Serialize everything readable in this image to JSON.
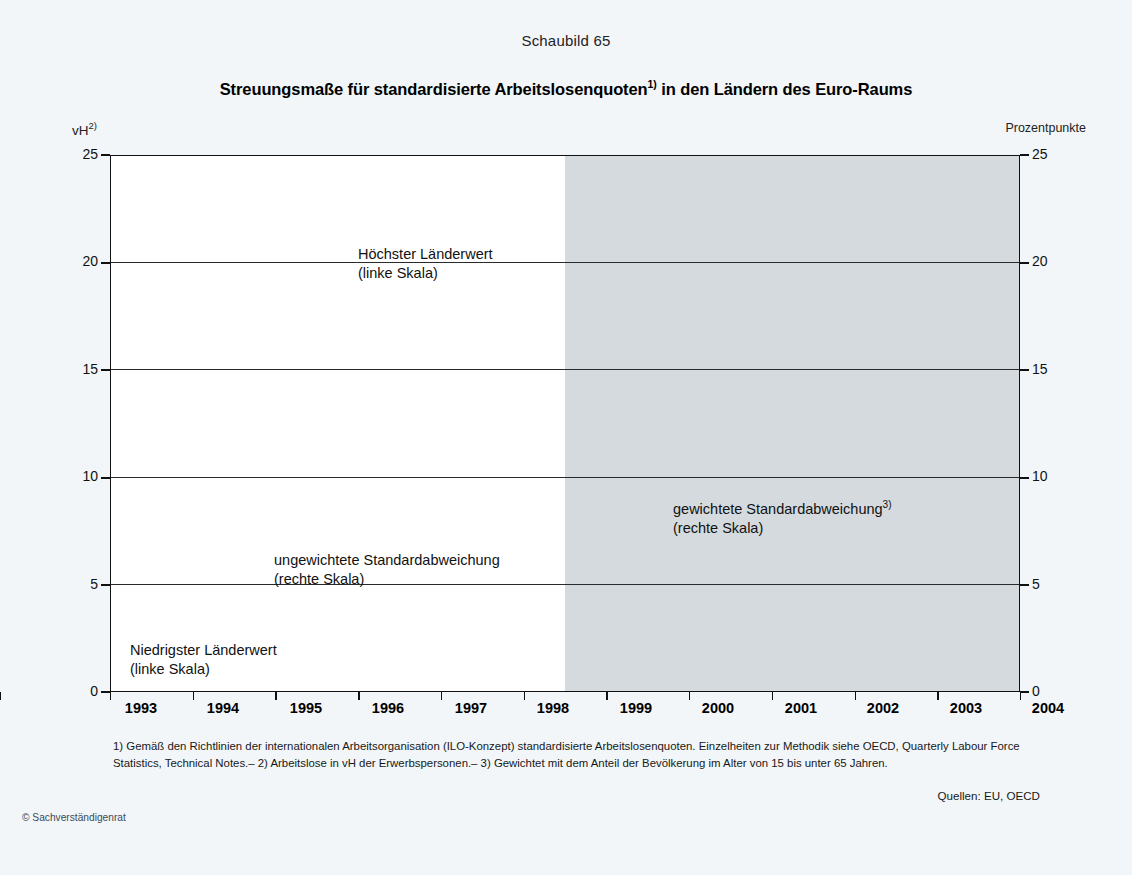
{
  "figure_number": "Schaubild 65",
  "title_main": "Streuungsmaße für standardisierte Arbeitslosenquoten",
  "title_sup": "1)",
  "title_tail": " in den Ländern des Euro-Raums",
  "axis": {
    "left_unit": "vH",
    "left_unit_sup": "2)",
    "right_unit": "Prozentpunkte"
  },
  "annotations": {
    "hoechster_l1": "Höchster Länderwert",
    "hoechster_l2": "(linke Skala)",
    "gewichtete_l1": "gewichtete Standardabweichung",
    "gewichtete_sup": "3)",
    "gewichtete_l2": "(rechte Skala)",
    "ungewichtete_l1": "ungewichtete Standardabweichung",
    "ungewichtete_l2": "(rechte Skala)",
    "niedrigster_l1": "Niedrigster Länderwert",
    "niedrigster_l2": "(linke Skala)"
  },
  "footnotes": "1) Gemäß den Richtlinien der internationalen Arbeitsorganisation (ILO-Konzept)  standardisierte Arbeitslosenquoten. Einzelheiten zur Methodik siehe OECD, Quarterly Labour Force Statistics, Technical Notes.– 2) Arbeitslose in vH der Erwerbspersonen.– 3) Gewichtet mit dem Anteil der Bevölkerung im Alter von 15 bis unter 65 Jahren.",
  "sources": "Quellen: EU, OECD",
  "copyright": "© Sachverständigenrat",
  "colors": {
    "line": "#111111",
    "shade": "#d4dade",
    "page": "#f2f6f9",
    "plot": "#ffffff"
  },
  "chart_data": {
    "type": "line",
    "title": "Streuungsmaße für standardisierte Arbeitslosenquoten1) in den Ländern des Euro-Raums",
    "subtitle": "Schaubild 65",
    "xlabel": "",
    "ylabel": "vH",
    "ylabel_right": "Prozentpunkte",
    "categories": [
      1993,
      1994,
      1995,
      1996,
      1997,
      1998,
      1999,
      2000,
      2001,
      2002,
      2003,
      2004
    ],
    "ylim": [
      0,
      25
    ],
    "yticks": [
      0,
      5,
      10,
      15,
      20,
      25
    ],
    "ylim_right": [
      0,
      25
    ],
    "yticks_right": [
      0,
      5,
      10,
      15,
      20,
      25
    ],
    "grid": true,
    "legend": "inline-annotations",
    "shaded_region": {
      "from": 1998.5,
      "to": 2004,
      "note": "grey shading from mid-1998 onwards"
    },
    "series": [
      {
        "name": "Höchster Länderwert (linke Skala)",
        "style": "solid",
        "axis": "left",
        "values": [
          18.6,
          19.8,
          18.8,
          18.1,
          17.2,
          15.2,
          13.0,
          11.6,
          10.9,
          11.7,
          11.7,
          11.2
        ]
      },
      {
        "name": "gewichtete Standardabweichung3) (rechte Skala)",
        "style": "dashed",
        "axis": "right",
        "values": [
          16.1,
          17.4,
          15.3,
          13.3,
          11.6,
          10.2,
          8.7,
          7.3,
          6.2,
          5.1,
          4.4,
          4.0
        ]
      },
      {
        "name": "ungewichtete Standardabweichung (rechte Skala)",
        "style": "dotted",
        "axis": "right",
        "values": [
          5.0,
          5.0,
          4.8,
          4.5,
          4.2,
          4.0,
          3.8,
          3.6,
          3.4,
          3.2,
          2.9,
          2.7
        ]
      },
      {
        "name": "Niedrigster Länderwert (linke Skala)",
        "style": "solid",
        "axis": "left",
        "values": [
          2.5,
          3.0,
          2.9,
          2.85,
          2.85,
          2.8,
          2.5,
          2.4,
          2.2,
          3.2,
          3.9,
          4.6
        ]
      }
    ]
  },
  "yticks_text": [
    "25",
    "20",
    "15",
    "10",
    "5",
    "0"
  ],
  "xticks_text": [
    "1993",
    "1994",
    "1995",
    "1996",
    "1997",
    "1998",
    "1999",
    "2000",
    "2001",
    "2002",
    "2003",
    "2004"
  ]
}
